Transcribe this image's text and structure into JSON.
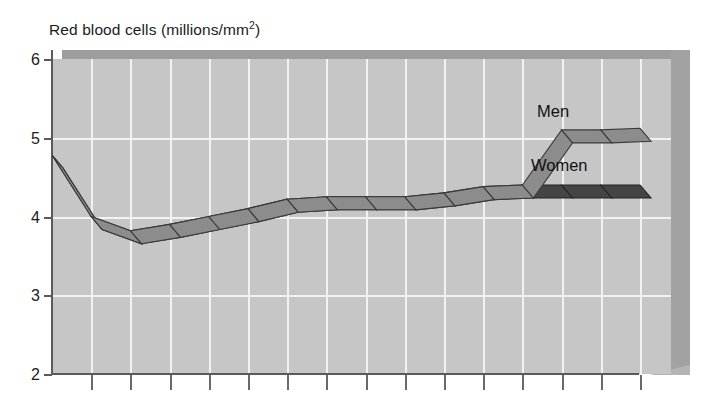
{
  "chart_data": {
    "type": "line",
    "title": "Red blood cells (millions/mm2)",
    "title_base": "Red blood cells (millions/mm",
    "title_sup": "2",
    "title_tail": ")",
    "xlabel": "",
    "ylabel": "Red blood cells (millions/mm2)",
    "ylim": [
      2,
      6
    ],
    "yticks": [
      6,
      5,
      4,
      3,
      2
    ],
    "ytick_labels": [
      "6",
      "5",
      "4",
      "3",
      "2"
    ],
    "xlim": [
      0,
      16
    ],
    "xtick_count": 15,
    "xtick_labels": [],
    "grid": true,
    "legend_position": "inline-right",
    "style": "3d-ribbon",
    "series": [
      {
        "name": "Men",
        "color": "#8c8c8c",
        "edge_color": "#3a3a3a",
        "x": [
          0,
          1,
          2,
          3,
          4,
          5,
          6,
          7,
          8,
          9,
          10,
          11,
          12,
          13,
          14,
          15
        ],
        "values": [
          4.78,
          4.0,
          3.82,
          3.9,
          4.0,
          4.1,
          4.22,
          4.25,
          4.25,
          4.25,
          4.3,
          4.38,
          4.4,
          5.1,
          5.1,
          5.12
        ]
      },
      {
        "name": "Women",
        "color": "#454545",
        "edge_color": "#222222",
        "x": [
          0,
          1,
          2,
          3,
          4,
          5,
          6,
          7,
          8,
          9,
          10,
          11,
          12,
          13,
          14,
          15
        ],
        "values": [
          4.78,
          4.0,
          3.82,
          3.9,
          4.0,
          4.1,
          4.22,
          4.25,
          4.25,
          4.25,
          4.3,
          4.38,
          4.4,
          4.4,
          4.4,
          4.4
        ]
      }
    ],
    "annotations": [
      {
        "text": "Men",
        "x": 12.6,
        "y": 5.35
      },
      {
        "text": "Women",
        "x": 12.4,
        "y": 4.68
      }
    ],
    "colors": {
      "plot_background": "#c6c6c6",
      "gridline": "#f2f2f2",
      "axis": "#5a5a5a",
      "ceiling_slab": "#9d9d9d",
      "wall_slab": "#a2a2a2",
      "text": "#1c1c1c",
      "men_band": "#8c8c8c",
      "women_band": "#454545"
    }
  },
  "labels": {
    "men": "Men",
    "women": "Women"
  }
}
